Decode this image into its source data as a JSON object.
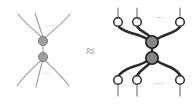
{
  "figure": {
    "width": 195,
    "height": 105,
    "background_color": "#ffffff",
    "relation_symbol": "≈",
    "relation_symbol_name": "approximately-equal",
    "ellipsis_text": "···"
  },
  "colors": {
    "thin_edge": "#9a9a9a",
    "thick_edge": "#2b2b2b",
    "light_node_fill": "#9d9d9d",
    "light_node_stroke": "#6f6f6f",
    "dark_node_fill": "#858585",
    "dark_node_stroke": "#1f1f1f",
    "open_node_fill": "#ffffff",
    "open_node_stroke": "#2b2b2b",
    "ellipsis_color": "#8a8a8a",
    "approx_color": "#8f8f8f"
  },
  "left_diagram": {
    "name": "left-graph",
    "node_count": 2,
    "node_style": "filled-gray-circle",
    "edge_style": "thin-curved",
    "terminal_markers": "none",
    "nodes": [
      {
        "id": "L-top",
        "label": "",
        "cx": 43,
        "cy": 41,
        "r": 4.6,
        "style": "light"
      },
      {
        "id": "L-bottom",
        "label": "",
        "cx": 43,
        "cy": 57,
        "r": 4.6,
        "style": "light"
      }
    ],
    "internal_edges": [
      {
        "from": "L-top",
        "to": "L-bottom"
      }
    ],
    "top_legs": 3,
    "bottom_legs": 3,
    "ellipsis": [
      {
        "id": "L-dots-top",
        "x": 50,
        "y": 26,
        "text": "···"
      },
      {
        "id": "L-dots-bottom",
        "x": 48,
        "y": 74,
        "text": "···"
      }
    ]
  },
  "right_diagram": {
    "name": "right-graph",
    "node_count": 2,
    "node_style": "filled-gray-circle-dark-outline",
    "edge_style": "thick-curved",
    "terminal_markers": "open-circle",
    "nodes": [
      {
        "id": "R-top",
        "label": "",
        "cx": 152,
        "cy": 42,
        "r": 6.2,
        "style": "dark"
      },
      {
        "id": "R-bottom",
        "label": "",
        "cx": 152,
        "cy": 58,
        "r": 6.2,
        "style": "dark"
      }
    ],
    "internal_edges": [
      {
        "from": "R-top",
        "to": "R-bottom"
      }
    ],
    "top_terminals": [
      {
        "id": "R-top-1",
        "cx": 118,
        "cy": 22,
        "r": 4.3
      },
      {
        "id": "R-top-2",
        "cx": 137,
        "cy": 22,
        "r": 4.3
      },
      {
        "id": "R-top-3",
        "cx": 180,
        "cy": 22,
        "r": 4.3
      }
    ],
    "bottom_terminals": [
      {
        "id": "R-bot-1",
        "cx": 118,
        "cy": 80,
        "r": 4.3
      },
      {
        "id": "R-bot-2",
        "cx": 137,
        "cy": 80,
        "r": 4.3
      },
      {
        "id": "R-bot-3",
        "cx": 180,
        "cy": 80,
        "r": 4.3
      }
    ],
    "ellipsis": [
      {
        "id": "R-dots-top",
        "x": 160,
        "y": 18,
        "text": "···"
      },
      {
        "id": "R-dots-bottom",
        "x": 159,
        "y": 84,
        "text": "···"
      }
    ]
  },
  "approx": {
    "id": "approx-symbol",
    "x": 90,
    "y": 53,
    "text": "≈"
  }
}
